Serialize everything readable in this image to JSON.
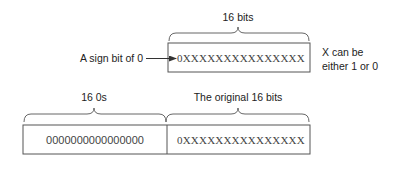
{
  "top": {
    "width_label": "16 bits",
    "value": "0XXXXXXXXXXXXXXX",
    "sign_label": "A sign bit of 0",
    "note_line1": "X can be",
    "note_line2": "either 1 or 0"
  },
  "bottom": {
    "left_label": "16 0s",
    "right_label": "The original 16 bits",
    "left_value": "0000000000000000",
    "right_value": "0XXXXXXXXXXXXXXX"
  },
  "colors": {
    "stroke": "#555555",
    "text": "#222222",
    "mono_text": "#444444",
    "background": "#ffffff"
  }
}
